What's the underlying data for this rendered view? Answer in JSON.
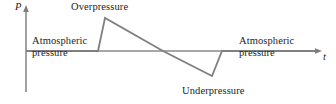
{
  "figure": {
    "axes": {
      "y_label": "P",
      "x_label": "t"
    },
    "annotations": {
      "overpressure": "Overpressure",
      "underpressure": "Underpressure",
      "atmospheric_left_line1": "Atmospheric",
      "atmospheric_left_line2": "pressure",
      "atmospheric_right_line1": "Atmospheric",
      "atmospheric_right_line2": "pressure"
    },
    "colors": {
      "curve": "#808080",
      "axis": "#8a8a8a",
      "text": "#1d1d1d",
      "background": "#ffffff"
    }
  },
  "chart_data": {
    "type": "line",
    "title": "",
    "xlabel": "t",
    "ylabel": "P",
    "grid": false,
    "legend": null,
    "axis_origin_px": {
      "x": 26,
      "y": 51
    },
    "x_axis_end_px": 322,
    "y_axis_top_px": 7,
    "y_axis_bottom_px": 92,
    "series": [
      {
        "name": "Pressure",
        "points_px": [
          {
            "x": 26,
            "y": 51
          },
          {
            "x": 98,
            "y": 51
          },
          {
            "x": 105,
            "y": 18
          },
          {
            "x": 163,
            "y": 51
          },
          {
            "x": 212,
            "y": 76
          },
          {
            "x": 222,
            "y": 51
          },
          {
            "x": 318,
            "y": 51
          }
        ],
        "phase_labels": [
          "ambient",
          "shock front rise",
          "positive phase decay",
          "negative phase minimum",
          "recovery",
          "ambient"
        ]
      }
    ],
    "markers": {
      "peak_overpressure_px": {
        "x": 105,
        "y": 18
      },
      "zero_crossing_px": {
        "x": 163,
        "y": 51
      },
      "peak_underpressure_px": {
        "x": 212,
        "y": 76
      }
    }
  }
}
